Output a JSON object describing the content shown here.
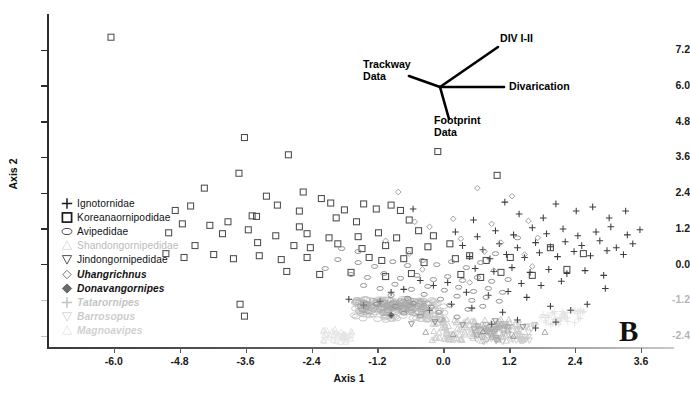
{
  "figure": {
    "panel_label": "B",
    "background": "#ffffff"
  },
  "axes": {
    "x": {
      "title": "Axis 1",
      "ticks": [
        "-6.0",
        "-4.8",
        "-3.6",
        "-2.4",
        "-1.2",
        "0.0",
        "1.2",
        "2.4",
        "3.6"
      ],
      "tick_values": [
        -6.0,
        -4.8,
        -3.6,
        -2.4,
        -1.2,
        0.0,
        1.2,
        2.4,
        3.6
      ],
      "min": -7.2,
      "max": 4.2
    },
    "y": {
      "title": "Axis 2",
      "ticks": [
        "7.2",
        "6.0",
        "4.8",
        "3.6",
        "2.4",
        "1.2",
        "0.0",
        "-1.2",
        "-2.4"
      ],
      "tick_values": [
        7.2,
        6.0,
        4.8,
        3.6,
        2.4,
        1.2,
        0.0,
        -1.2,
        -2.4
      ],
      "min": -2.8,
      "max": 8.4
    }
  },
  "legend": {
    "items": [
      {
        "label": "Ignotornidae",
        "symbol": "plus",
        "italic": false,
        "fade": 0
      },
      {
        "label": "Koreanaornipodidae",
        "symbol": "square",
        "italic": false,
        "fade": 0
      },
      {
        "label": "Avipedidae",
        "symbol": "ellipse",
        "italic": false,
        "fade": 0
      },
      {
        "label": "Shandongornipedidae",
        "symbol": "triangle-up",
        "italic": false,
        "fade": 1
      },
      {
        "label": "Jindongornipedidae",
        "symbol": "triangle-down",
        "italic": false,
        "fade": 0
      },
      {
        "label": "Uhangrichnus",
        "symbol": "diamond-outline",
        "italic": true,
        "fade": 0
      },
      {
        "label": "Donavangornipes",
        "symbol": "diamond-filled",
        "italic": true,
        "fade": 0
      },
      {
        "label": "Tatarornipes",
        "symbol": "plus",
        "italic": true,
        "fade": 2
      },
      {
        "label": "Barrosopus",
        "symbol": "triangle-down",
        "italic": true,
        "fade": 3
      },
      {
        "label": "Magnoavipes",
        "symbol": "triangle-up",
        "italic": true,
        "fade": 4
      }
    ]
  },
  "vector_diagram": {
    "labels": {
      "div": "DIV I-II",
      "divarication": "Divarication",
      "trackway": "Trackway\nData",
      "footprint": "Footprint\nData"
    }
  },
  "chart_data": {
    "type": "scatter",
    "title": "",
    "xlabel": "Axis 1",
    "ylabel": "Axis 2",
    "xlim": [
      -7.2,
      4.2
    ],
    "ylim": [
      -2.8,
      8.4
    ],
    "grid": false,
    "legend_position": "left-inside",
    "annotations": [
      {
        "text": "DIV I-II",
        "x": 1.05,
        "y": 7.65
      },
      {
        "text": "Divarication",
        "x": 1.05,
        "y": 5.85
      },
      {
        "text": "Trackway Data",
        "x": -1.55,
        "y": 6.55
      },
      {
        "text": "Footprint Data",
        "x": -0.55,
        "y": 4.35
      },
      {
        "text": "B",
        "x": 3.35,
        "y": -2.0
      }
    ],
    "series": [
      {
        "name": "Koreanaornipodidae",
        "symbol": "square",
        "color": "#4d4d4d",
        "points": [
          [
            -6.05,
            7.62
          ],
          [
            -3.62,
            4.25
          ],
          [
            -2.82,
            3.67
          ],
          [
            -3.72,
            3.05
          ],
          [
            -0.1,
            3.78
          ],
          [
            0.98,
            2.98
          ],
          [
            -4.35,
            2.55
          ],
          [
            -3.22,
            2.28
          ],
          [
            -2.55,
            2.42
          ],
          [
            -2.22,
            2.2
          ],
          [
            -3.02,
            1.98
          ],
          [
            -4.6,
            1.95
          ],
          [
            -4.88,
            1.8
          ],
          [
            -2.05,
            2.05
          ],
          [
            -1.8,
            1.82
          ],
          [
            -1.45,
            2.02
          ],
          [
            -1.22,
            1.85
          ],
          [
            -3.48,
            1.62
          ],
          [
            -3.4,
            1.6
          ],
          [
            -2.62,
            1.78
          ],
          [
            -1.95,
            1.55
          ],
          [
            -0.95,
            1.98
          ],
          [
            -0.78,
            1.8
          ],
          [
            -4.75,
            1.35
          ],
          [
            -4.25,
            1.3
          ],
          [
            -3.92,
            1.42
          ],
          [
            -3.55,
            1.15
          ],
          [
            -2.62,
            1.25
          ],
          [
            -1.58,
            1.42
          ],
          [
            -0.62,
            1.48
          ],
          [
            -5.0,
            1.05
          ],
          [
            -4.02,
            1.02
          ],
          [
            -3.05,
            0.95
          ],
          [
            -2.48,
            1.02
          ],
          [
            -2.08,
            0.88
          ],
          [
            -1.55,
            0.92
          ],
          [
            -1.18,
            1.05
          ],
          [
            -0.85,
            0.88
          ],
          [
            -0.45,
            1.12
          ],
          [
            -0.18,
            0.95
          ],
          [
            -4.52,
            0.62
          ],
          [
            -3.38,
            0.72
          ],
          [
            -2.72,
            0.62
          ],
          [
            -2.42,
            0.55
          ],
          [
            -1.92,
            0.68
          ],
          [
            -1.48,
            0.52
          ],
          [
            -1.05,
            0.62
          ],
          [
            -0.62,
            0.45
          ],
          [
            -0.28,
            0.58
          ],
          [
            0.12,
            0.68
          ],
          [
            -5.05,
            0.35
          ],
          [
            -4.72,
            0.22
          ],
          [
            -4.18,
            0.32
          ],
          [
            -3.82,
            0.18
          ],
          [
            -3.35,
            0.28
          ],
          [
            -2.95,
            0.15
          ],
          [
            -2.48,
            0.22
          ],
          [
            -1.35,
            0.22
          ],
          [
            -1.12,
            0.12
          ],
          [
            -0.72,
            0.18
          ],
          [
            -0.35,
            0.05
          ],
          [
            0.22,
            0.18
          ],
          [
            0.48,
            0.28
          ],
          [
            0.78,
            0.12
          ],
          [
            1.22,
            0.22
          ],
          [
            -2.85,
            -0.25
          ],
          [
            -2.25,
            -0.35
          ],
          [
            -1.68,
            -0.28
          ],
          [
            -1.05,
            -0.42
          ],
          [
            -0.58,
            -0.32
          ],
          [
            0.32,
            -0.35
          ],
          [
            0.68,
            -0.45
          ],
          [
            1.05,
            -0.28
          ],
          [
            1.62,
            -0.38
          ],
          [
            -3.7,
            -1.35
          ],
          [
            -3.62,
            -1.75
          ],
          [
            2.25,
            -0.18
          ],
          [
            1.95,
            0.55
          ],
          [
            2.55,
            0.35
          ]
        ]
      },
      {
        "name": "Ignotornidae",
        "symbol": "plus",
        "color": "#3c3c3c",
        "points": [
          [
            -0.55,
            1.85
          ],
          [
            0.55,
            1.48
          ],
          [
            1.12,
            2.08
          ],
          [
            1.38,
            1.68
          ],
          [
            1.82,
            1.55
          ],
          [
            2.05,
            2.02
          ],
          [
            2.42,
            1.78
          ],
          [
            2.72,
            1.92
          ],
          [
            3.02,
            1.55
          ],
          [
            3.32,
            1.78
          ],
          [
            0.22,
            1.08
          ],
          [
            0.62,
            0.92
          ],
          [
            0.95,
            1.12
          ],
          [
            1.28,
            0.98
          ],
          [
            1.62,
            1.22
          ],
          [
            1.88,
            1.02
          ],
          [
            2.18,
            1.18
          ],
          [
            2.45,
            0.95
          ],
          [
            2.78,
            1.08
          ],
          [
            3.05,
            1.25
          ],
          [
            3.35,
            0.98
          ],
          [
            3.58,
            1.15
          ],
          [
            0.35,
            0.62
          ],
          [
            0.72,
            0.48
          ],
          [
            1.02,
            0.68
          ],
          [
            1.35,
            0.55
          ],
          [
            1.68,
            0.72
          ],
          [
            1.95,
            0.58
          ],
          [
            2.22,
            0.75
          ],
          [
            2.52,
            0.62
          ],
          [
            2.85,
            0.78
          ],
          [
            3.15,
            0.55
          ],
          [
            3.45,
            0.68
          ],
          [
            0.48,
            0.25
          ],
          [
            0.85,
            0.18
          ],
          [
            1.15,
            0.32
          ],
          [
            1.48,
            0.22
          ],
          [
            1.75,
            0.38
          ],
          [
            2.08,
            0.25
          ],
          [
            2.38,
            0.42
          ],
          [
            2.68,
            0.28
          ],
          [
            2.98,
            0.45
          ],
          [
            3.28,
            0.32
          ],
          [
            0.58,
            -0.15
          ],
          [
            0.92,
            -0.25
          ],
          [
            1.25,
            -0.12
          ],
          [
            1.58,
            -0.28
          ],
          [
            1.92,
            -0.18
          ],
          [
            2.25,
            -0.32
          ],
          [
            2.58,
            -0.22
          ],
          [
            2.92,
            -0.38
          ],
          [
            1.42,
            -0.65
          ],
          [
            1.78,
            -0.72
          ],
          [
            2.15,
            -0.58
          ],
          [
            2.95,
            -0.82
          ],
          [
            0.42,
            -0.95
          ],
          [
            0.82,
            -1.05
          ],
          [
            1.18,
            -0.92
          ],
          [
            1.52,
            -1.12
          ],
          [
            -0.42,
            -0.55
          ],
          [
            -0.18,
            -0.72
          ],
          [
            0.08,
            -0.62
          ],
          [
            -0.72,
            -0.85
          ],
          [
            -0.95,
            -0.95
          ],
          [
            0.15,
            -1.35
          ],
          [
            0.52,
            -1.48
          ],
          [
            -0.25,
            -1.55
          ],
          [
            1.08,
            -1.62
          ],
          [
            1.95,
            -1.42
          ],
          [
            2.32,
            -1.55
          ],
          [
            2.62,
            -1.35
          ],
          [
            1.35,
            -1.88
          ],
          [
            0.88,
            -2.02
          ],
          [
            1.68,
            -2.15
          ],
          [
            2.05,
            -1.95
          ],
          [
            -1.15,
            -1.25
          ],
          [
            -1.45,
            -1.38
          ],
          [
            -1.72,
            -1.18
          ]
        ]
      },
      {
        "name": "Avipedidae",
        "symbol": "ellipse",
        "color": "#8c8c8c",
        "points": [
          [
            -1.92,
            0.15
          ],
          [
            -1.55,
            0.05
          ],
          [
            -1.25,
            -0.08
          ],
          [
            -0.92,
            0.08
          ],
          [
            -0.65,
            -0.05
          ],
          [
            -0.38,
            0.12
          ],
          [
            -0.12,
            -0.02
          ],
          [
            0.15,
            0.08
          ],
          [
            0.42,
            -0.12
          ],
          [
            0.68,
            0.05
          ],
          [
            -1.68,
            -0.35
          ],
          [
            -1.38,
            -0.45
          ],
          [
            -1.08,
            -0.32
          ],
          [
            -0.78,
            -0.48
          ],
          [
            -0.48,
            -0.38
          ],
          [
            -0.18,
            -0.52
          ],
          [
            0.08,
            -0.42
          ],
          [
            0.35,
            -0.55
          ],
          [
            0.62,
            -0.45
          ],
          [
            0.88,
            -0.58
          ],
          [
            -1.45,
            -0.72
          ],
          [
            -1.15,
            -0.82
          ],
          [
            -0.88,
            -0.68
          ],
          [
            -0.58,
            -0.85
          ],
          [
            -0.28,
            -0.75
          ],
          [
            0.02,
            -0.88
          ],
          [
            0.28,
            -0.78
          ],
          [
            0.55,
            -0.92
          ],
          [
            0.82,
            -0.82
          ],
          [
            1.08,
            -0.95
          ],
          [
            -0.95,
            -1.05
          ],
          [
            -0.65,
            -1.15
          ],
          [
            -0.35,
            -1.02
          ],
          [
            -0.05,
            -1.18
          ],
          [
            0.25,
            -1.08
          ],
          [
            0.52,
            -1.22
          ],
          [
            0.78,
            -1.12
          ],
          [
            1.02,
            -1.25
          ],
          [
            -1.22,
            -1.35
          ],
          [
            -0.88,
            -1.42
          ],
          [
            -0.55,
            -1.32
          ],
          [
            -0.22,
            -1.45
          ],
          [
            0.12,
            -1.38
          ],
          [
            0.45,
            -1.52
          ],
          [
            0.72,
            -1.42
          ],
          [
            -0.72,
            -1.65
          ],
          [
            -0.42,
            -1.75
          ],
          [
            -0.08,
            -1.62
          ],
          [
            0.25,
            -1.78
          ],
          [
            -1.85,
            0.52
          ],
          [
            -1.55,
            0.42
          ],
          [
            -2.15,
            -0.15
          ],
          [
            0.95,
            0.35
          ],
          [
            1.18,
            -0.52
          ],
          [
            1.35,
            0.88
          ]
        ]
      },
      {
        "name": "Uhangrichnus",
        "symbol": "diamond-outline",
        "color": "#9a9a9a",
        "points": [
          [
            -0.82,
            2.42
          ],
          [
            0.62,
            2.55
          ],
          [
            1.25,
            2.28
          ],
          [
            -0.52,
            1.42
          ],
          [
            -0.25,
            1.25
          ],
          [
            0.18,
            1.52
          ],
          [
            0.88,
            1.35
          ],
          [
            1.55,
            1.45
          ],
          [
            -1.05,
            0.78
          ],
          [
            0.32,
            0.85
          ],
          [
            1.05,
            0.72
          ],
          [
            1.72,
            0.88
          ],
          [
            -0.62,
            0.35
          ],
          [
            0.75,
            0.42
          ],
          [
            1.48,
            0.32
          ],
          [
            -0.38,
            -0.18
          ],
          [
            0.92,
            -0.22
          ],
          [
            1.62,
            -0.08
          ],
          [
            0.48,
            -0.62
          ]
        ]
      },
      {
        "name": "Donavangornipes",
        "symbol": "diamond-filled",
        "color": "#3a3a3a",
        "points": [
          [
            -0.95,
            -1.72
          ]
        ]
      },
      {
        "name": "Jindongornipedidae",
        "symbol": "triangle-down",
        "color": "#8f8f8f",
        "points": [
          [
            -0.15,
            -1.95
          ],
          [
            0.35,
            -2.05
          ],
          [
            0.95,
            -1.92
          ],
          [
            1.45,
            -2.12
          ],
          [
            -0.58,
            -2.02
          ]
        ]
      },
      {
        "name": "Shandongornipedidae",
        "symbol": "triangle-up",
        "color": "#a5a5a5",
        "points": [
          [
            -0.32,
            -2.28
          ],
          [
            0.18,
            -2.35
          ],
          [
            0.72,
            -2.25
          ],
          [
            1.28,
            -2.42
          ],
          [
            1.85,
            -2.28
          ]
        ]
      }
    ]
  }
}
